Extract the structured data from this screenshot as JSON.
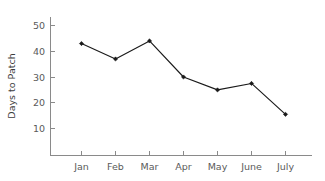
{
  "chart_data": {
    "type": "line",
    "title": "",
    "subtitle": "",
    "xlabel": "",
    "ylabel": "Days to Patch",
    "categories": [
      "Jan",
      "Feb",
      "Mar",
      "Apr",
      "May",
      "June",
      "July"
    ],
    "values": [
      43,
      37,
      44,
      30,
      25,
      27.5,
      15.5
    ],
    "series": [
      {
        "name": "Days to Patch",
        "values": [
          43,
          37,
          44,
          30,
          25,
          27.5,
          15.5
        ],
        "color": "#1a1a1a",
        "marker": "square"
      }
    ],
    "ylim": [
      0,
      55
    ],
    "xlim": [
      0,
      8
    ],
    "yticks": [
      10,
      20,
      30,
      40,
      50
    ],
    "ytick_labels": [
      "10",
      "20",
      "30",
      "40",
      "50"
    ],
    "xtick_labels": [
      "Jan",
      "Feb",
      "Mar",
      "Apr",
      "May",
      "June",
      "July"
    ],
    "grid": false,
    "legend": false,
    "legend_position": "none",
    "axis_color": "#8a8a8a",
    "background_color": "#ffffff",
    "annotations": []
  },
  "figure": {
    "ylabel_text": "Days to Patch"
  }
}
